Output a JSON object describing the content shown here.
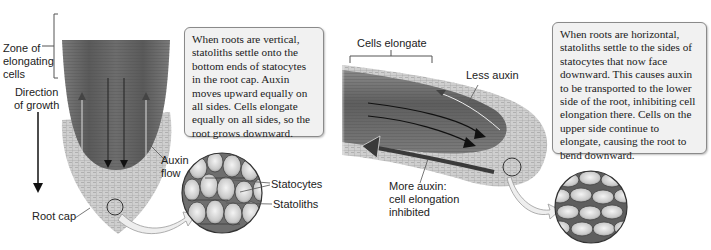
{
  "figure": {
    "left_panel": {
      "title": "Vertical root gravitropism",
      "labels": {
        "zone": "Zone of\nelongating\ncells",
        "zone_lines": [
          "Zone of",
          "elongating",
          "cells"
        ],
        "direction_lines": [
          "Direction",
          "of growth"
        ],
        "auxin_flow_lines": [
          "Auxin",
          "flow"
        ],
        "root_cap": "Root cap",
        "statocytes": "Statocytes",
        "statoliths": "Statoliths"
      },
      "caption": "When roots are vertical, statoliths settle onto the bottom ends of statocytes in the root cap. Auxin moves upward equally on all sides. Cells elongate equally on all sides, so the root grows downward."
    },
    "right_panel": {
      "title": "Horizontal root gravitropism",
      "labels": {
        "cells_elongate": "Cells elongate",
        "less_auxin": "Less auxin",
        "more_auxin_lines": [
          "More auxin:",
          "cell elongation",
          "inhibited"
        ]
      },
      "caption": "When roots are horizontal, statoliths settle to the sides of statocytes that now face downward. This causes auxin to be transported to the lower side of the root, inhibiting cell elongation there. Cells on the upper side continue to elongate, causing the root to bend downward."
    },
    "colors": {
      "background": "#ffffff",
      "root_dark": "#5e5e5e",
      "root_mid": "#8c8c8c",
      "root_cap": "#c9c9c9",
      "box_fill": "#f1f1f1",
      "box_border": "#8a8a8a",
      "text": "#222222"
    }
  }
}
